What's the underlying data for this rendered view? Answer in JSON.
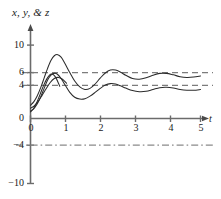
{
  "chart_data": {
    "type": "line",
    "title": "",
    "subtitle": "",
    "xlabel": "t",
    "ylabel": "x, y, & z",
    "xlim": [
      -0.25,
      5.15
    ],
    "ylim": [
      -11.5,
      11.5
    ],
    "grid": false,
    "legend": null,
    "xticks": [
      0,
      1,
      2,
      3,
      4,
      5
    ],
    "xtick_labels": [
      "0",
      "1",
      "2",
      "3",
      "4",
      "5"
    ],
    "yticks": [
      -10,
      -4,
      0,
      4,
      6,
      10
    ],
    "ytick_labels": [
      "−10",
      "−4",
      "0",
      "4",
      "6",
      "10"
    ],
    "reference_lines": [
      {
        "name": "y-equals-6",
        "value": 6,
        "style": "dashed"
      },
      {
        "name": "y-equals-4",
        "value": 4,
        "style": "dashed"
      },
      {
        "name": "y-equals-minus-4",
        "value": -4,
        "style": "dash-dot"
      }
    ],
    "series": [
      {
        "name": "x",
        "style": "solid",
        "color": "#2b2b2b",
        "x": [
          0.0,
          0.1,
          0.2,
          0.3,
          0.4,
          0.5,
          0.6,
          0.7,
          0.8,
          0.9,
          1.0,
          1.15,
          1.3,
          1.45,
          1.6,
          1.75,
          1.9,
          2.05,
          2.2,
          2.35,
          2.5,
          2.65,
          2.8,
          3.0,
          3.2,
          3.4,
          3.6,
          3.8,
          4.0,
          4.2,
          4.4,
          4.6,
          4.8,
          5.0
        ],
        "y": [
          1.8,
          2.3,
          3.1,
          4.2,
          5.5,
          6.8,
          7.9,
          8.55,
          8.7,
          8.35,
          7.6,
          6.3,
          5.1,
          4.3,
          3.95,
          4.1,
          4.7,
          5.5,
          6.2,
          6.6,
          6.6,
          6.3,
          5.9,
          5.45,
          5.35,
          5.55,
          5.9,
          6.15,
          6.15,
          5.95,
          5.7,
          5.6,
          5.65,
          5.8
        ]
      },
      {
        "name": "y",
        "style": "solid",
        "color": "#2b2b2b",
        "x": [
          0.0,
          0.1,
          0.2,
          0.3,
          0.4,
          0.5,
          0.6,
          0.7,
          0.8,
          0.9,
          1.0,
          1.15,
          1.3,
          1.45,
          1.6,
          1.75,
          1.9,
          2.05,
          2.2,
          2.35,
          2.5,
          2.65,
          2.8,
          3.0,
          3.2,
          3.4,
          3.6,
          3.8,
          4.0,
          4.2,
          4.4,
          4.6,
          4.8,
          5.0
        ],
        "y": [
          1.0,
          1.35,
          2.0,
          2.95,
          4.1,
          5.2,
          5.9,
          6.15,
          6.0,
          5.45,
          4.7,
          3.6,
          2.9,
          2.65,
          2.7,
          3.05,
          3.55,
          4.1,
          4.55,
          4.75,
          4.7,
          4.45,
          4.15,
          3.8,
          3.65,
          3.7,
          3.95,
          4.2,
          4.25,
          4.15,
          3.95,
          3.85,
          3.85,
          3.95
        ]
      },
      {
        "name": "z",
        "style": "solid",
        "color": "#2b2b2b",
        "x": [
          0.0,
          0.08,
          0.16,
          0.24,
          0.32,
          0.4,
          0.48,
          0.56,
          0.62,
          0.68,
          0.74,
          0.8,
          0.86
        ],
        "y": [
          0.9,
          1.3,
          1.95,
          2.8,
          3.75,
          4.65,
          5.4,
          5.9,
          6.05,
          5.95,
          5.6,
          5.05,
          4.4
        ]
      },
      {
        "name": "z-lower-branch",
        "style": "solid",
        "color": "#2b2b2b",
        "x": [
          0.0,
          0.1,
          0.22,
          0.34,
          0.46,
          0.58,
          0.7,
          0.82,
          0.94,
          1.06
        ],
        "y": [
          1.4,
          1.7,
          2.3,
          3.15,
          4.05,
          4.9,
          5.45,
          5.6,
          5.35,
          4.8
        ]
      }
    ],
    "annotations": {
      "peak_1": {
        "t": 0.8,
        "value": 8.7
      },
      "peak_2": {
        "t": 2.4,
        "value": 6.6
      },
      "steady_state_upper": 5.8,
      "steady_state_lower": 3.95
    },
    "colors": {
      "axis": "#6b6b6b",
      "curve": "#2b2b2b",
      "reference": "#7a7a7a",
      "text": "#1a1a1a",
      "background": "#ffffff"
    }
  }
}
